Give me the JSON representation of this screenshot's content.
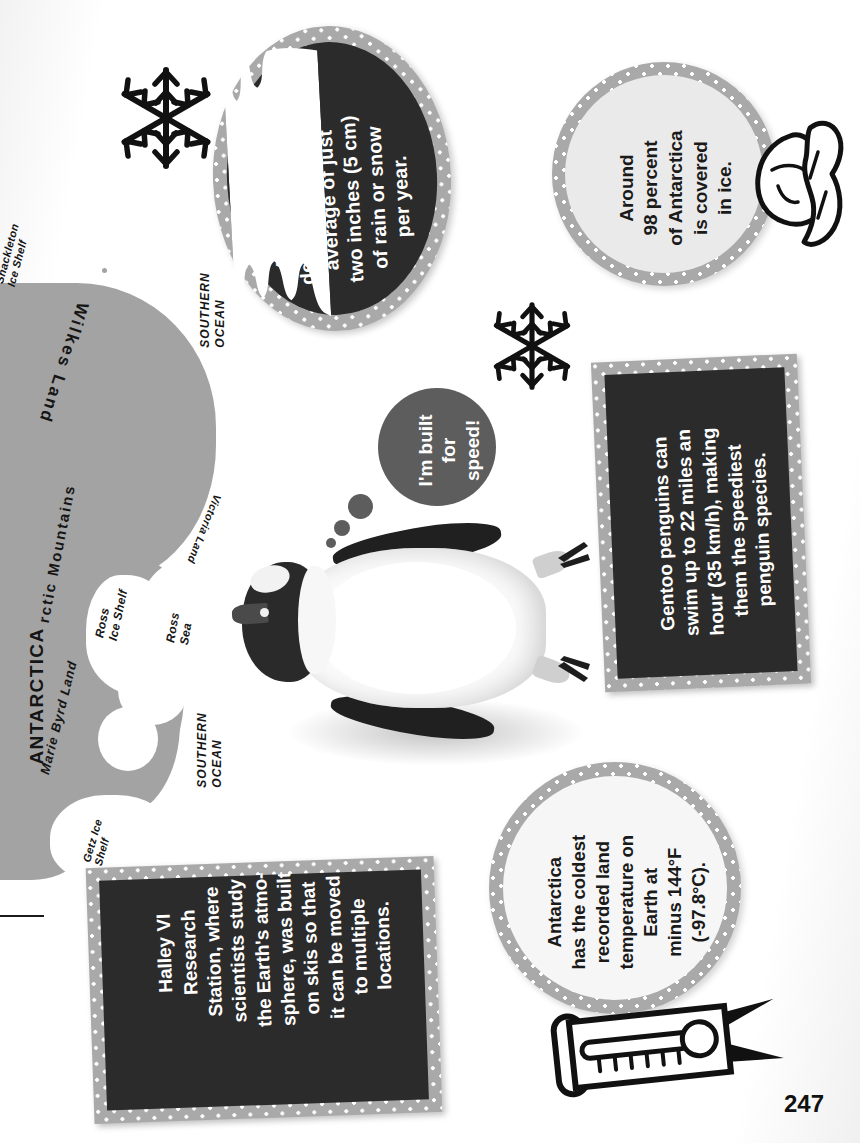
{
  "page": {
    "number": "247",
    "orientation": "sideways",
    "colors": {
      "dotted_border": "#a9a9a9",
      "dark_panel": "#2b2b2b",
      "light_panel": "#eaeaea",
      "bubble": "#5d5d5d",
      "land": "#a3a3a3",
      "ice": "#ffffff",
      "text_light": "#ffffff",
      "text_dark": "#1a1a1a"
    }
  },
  "map": {
    "labels": [
      {
        "text": "Shackleton\nIce Shelf",
        "name": "map-label-shackleton-ice-shelf"
      },
      {
        "text": "Wilkes Land",
        "name": "map-label-wilkes-land"
      },
      {
        "text": "SOUTHERN\nOCEAN",
        "name": "map-label-southern-ocean-top"
      },
      {
        "text": "rctic Mountains",
        "name": "map-label-transantarctic-mountains"
      },
      {
        "text": "Victoria Land",
        "name": "map-label-victoria-land"
      },
      {
        "text": "ANTARCTICA",
        "name": "map-label-antarctica"
      },
      {
        "text": "Marie Byrd Land",
        "name": "map-label-marie-byrd-land"
      },
      {
        "text": "Ross\nIce Shelf",
        "name": "map-label-ross-ice-shelf"
      },
      {
        "text": "Ross\nSea",
        "name": "map-label-ross-sea"
      },
      {
        "text": "Getz Ice\nShelf",
        "name": "map-label-getz-ice-shelf"
      },
      {
        "text": "SOUTHERN\nOCEAN",
        "name": "map-label-southern-ocean-bottom"
      }
    ]
  },
  "facts": {
    "desert": {
      "style": "circle-dark",
      "text": "Antarctica is a\ndesert—it gets an\naverage of just\ntwo inches (5 cm)\nof rain or snow\nper year."
    },
    "ice_cover": {
      "style": "circle-light",
      "text": "Around\n98 percent\nof Antarctica\nis covered\nin ice.",
      "emphasis": "98 percent"
    },
    "gentoo": {
      "style": "rect-dark",
      "text": "Gentoo penguins can\nswim up to 22 miles an\nhour (35 km/h), making\nthem the speediest\npenguin species."
    },
    "halley": {
      "style": "rect-dark",
      "text": "Halley VI\nResearch\nStation, where\nscientists study\nthe Earth's atmo-\nsphere, was built\non skis so that\nit can be moved\nto multiple\nlocations."
    },
    "coldest": {
      "style": "circle-light",
      "text": "Antarctica\nhas the coldest\nrecorded land\ntemperature on\nEarth at\nminus 144°F\n(-97.8°C)."
    }
  },
  "speech_bubble": {
    "text": "I'm built\nfor\nspeed!"
  },
  "icons": [
    {
      "name": "snowflake-icon-top",
      "label": "snowflake"
    },
    {
      "name": "snowflake-icon-middle",
      "label": "snowflake"
    },
    {
      "name": "iceberg-icon",
      "label": "iceberg"
    },
    {
      "name": "thermometer-icon",
      "label": "thermometer"
    },
    {
      "name": "penguin-photo",
      "label": "gentoo penguin"
    }
  ]
}
